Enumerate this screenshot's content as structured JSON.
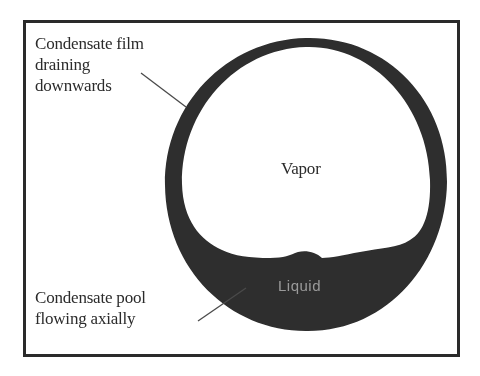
{
  "diagram": {
    "type": "cross-section",
    "labels": {
      "film": [
        "Condensate film",
        "draining",
        "downwards"
      ],
      "pool": [
        "Condensate pool",
        "flowing axially"
      ],
      "vapor": "Vapor",
      "liquid": "Liquid"
    },
    "colors": {
      "background": "#ffffff",
      "frame": "#2a2a2a",
      "tube_wall_and_liquid": "#2d2d2d",
      "text": "#2b2b2b",
      "liquid_label": "#9a9a9a"
    },
    "geometry": {
      "tube_center": [
        306,
        182
      ],
      "tube_outer_radius": 141,
      "film_thickness_top": 9,
      "film_thickness_sides": 16,
      "pool_surface_y": 258
    }
  }
}
